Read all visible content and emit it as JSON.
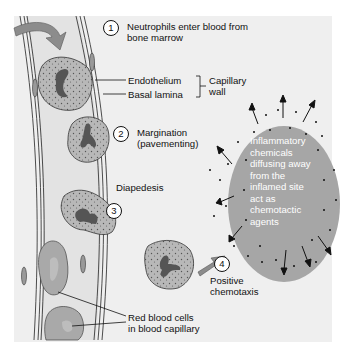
{
  "diagram": {
    "colors": {
      "background": "#efefef",
      "vessel_lumen": "#e3e3e3",
      "neutrophil": "#b8b8b8",
      "nucleus": "#555555",
      "red_blood_cell": "#a9a9a9",
      "chemical_cloud": "#a6a6a6",
      "arrow_fill": "#8c8c8c",
      "text": "#111111"
    },
    "steps": [
      {
        "number": "1",
        "label_line1": "Neutrophils enter blood from",
        "label_line2": "bone marrow"
      },
      {
        "number": "2",
        "label_line1": "Margination",
        "label_line2": "(pavementing)"
      },
      {
        "number": "3",
        "label_line1": "Diapedesis"
      },
      {
        "number": "4",
        "label_line1": "Positive",
        "label_line2": "chemotaxis"
      }
    ],
    "wall_labels": {
      "endothelium": "Endothelium",
      "basal_lamina": "Basal lamina",
      "group_line1": "Capillary",
      "group_line2": "wall"
    },
    "cloud_text": [
      "Inflammatory",
      "chemicals",
      "diffusing away",
      "from the",
      "inflamed site",
      "act as",
      "chemotactic",
      "agents"
    ],
    "rbc_label": {
      "line1": "Red blood cells",
      "line2": "in blood capillary"
    }
  }
}
